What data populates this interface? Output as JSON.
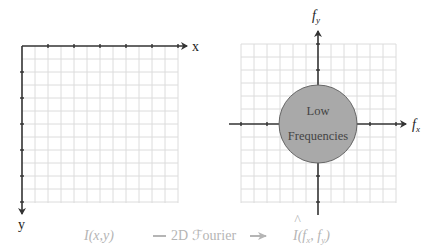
{
  "left_panel": {
    "x_axis_label": "x",
    "y_axis_label": "y",
    "caption": "I(x,y)"
  },
  "right_panel": {
    "fx_axis_label": "f",
    "fx_subscript": "x",
    "fy_axis_label": "f",
    "fy_subscript": "y",
    "circle_line1": "Low",
    "circle_line2": "Frequencies",
    "caption_prefix": "I",
    "caption_args": "(f",
    "caption_args_sub1": "x",
    "caption_args_mid": ", f",
    "caption_args_sub2": "y",
    "caption_args_end": ")"
  },
  "transform": {
    "label": "2D ℱourier"
  },
  "colors": {
    "grid": "#d9d9d9",
    "axis": "#333333",
    "circle_fill": "#a9a9a9",
    "circle_stroke": "#666666",
    "caption": "#b5b5b5"
  }
}
